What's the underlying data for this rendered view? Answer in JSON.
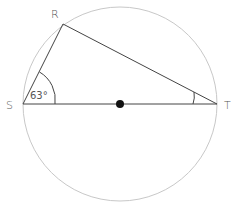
{
  "diagram": {
    "type": "circle-geometry",
    "points": {
      "R": {
        "label": "R"
      },
      "S": {
        "label": "S"
      },
      "T": {
        "label": "T"
      }
    },
    "angle_S": {
      "label": "63°"
    },
    "center": {
      "marker": "filled-dot"
    },
    "colors": {
      "circle": "#c8c8c8",
      "lines": "#444444",
      "labels": "#555555",
      "center_dot": "#111111"
    }
  }
}
